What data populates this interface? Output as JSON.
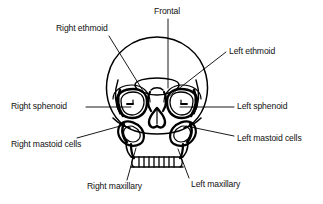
{
  "figure": {
    "view": "anterior",
    "line_color": "#000000",
    "background_color": "#ffffff",
    "text_color": "#111111"
  },
  "labels": [
    {
      "id": "frontal",
      "text": "Frontal",
      "side": "center",
      "anchor": "left",
      "x": 154,
      "y": 6,
      "leader": {
        "type": "straight",
        "points": "168,19 168,88"
      },
      "target": "frontal sinus"
    },
    {
      "id": "right-ethmoid",
      "text": "Right ethmoid",
      "side": "right",
      "anchor": "left",
      "x": 56,
      "y": 23,
      "leader": {
        "type": "straight",
        "points": "109,36 148,99"
      },
      "target": "right ethmoid air cells"
    },
    {
      "id": "left-ethmoid",
      "text": "Left ethmoid",
      "side": "left",
      "anchor": "left",
      "x": 229,
      "y": 46,
      "leader": {
        "type": "straight",
        "points": "226,52 168,97"
      },
      "target": "left ethmoid air cells"
    },
    {
      "id": "right-sphenoid",
      "text": "Right sphenoid",
      "side": "right",
      "anchor": "right",
      "x": 11,
      "y": 101,
      "leader": {
        "type": "straight",
        "points": "86,107 131,107"
      },
      "target": "right sphenoid sinus"
    },
    {
      "id": "left-sphenoid",
      "text": "Left sphenoid",
      "side": "left",
      "anchor": "left",
      "x": 237,
      "y": 101,
      "leader": {
        "type": "straight",
        "points": "234,107 180,107"
      },
      "target": "left sphenoid sinus"
    },
    {
      "id": "right-mastoid-cells",
      "text": "Right mastoid cells",
      "side": "right",
      "anchor": "right",
      "x": 11,
      "y": 139,
      "leader": {
        "type": "straight",
        "points": "77,138 124,125"
      },
      "target": "right mastoid air cells"
    },
    {
      "id": "left-mastoid-cells",
      "text": "Left mastoid cells",
      "side": "left",
      "anchor": "left",
      "x": 237,
      "y": 133,
      "leader": {
        "type": "straight",
        "points": "234,136 186,126"
      },
      "target": "left mastoid air cells"
    },
    {
      "id": "right-maxillary",
      "text": "Right maxillary",
      "side": "right",
      "anchor": "left",
      "x": 87,
      "y": 181,
      "leader": {
        "type": "straight",
        "points": "127,180 136,148"
      },
      "target": "right maxillary sinus"
    },
    {
      "id": "left-maxillary",
      "text": "Left maxillary",
      "side": "left",
      "anchor": "left",
      "x": 191,
      "y": 179,
      "leader": {
        "type": "straight",
        "points": "189,178 178,149"
      },
      "target": "left maxillary sinus"
    }
  ],
  "anatomy": {
    "structures": [
      "cranial vault",
      "frontal sinus",
      "right orbit",
      "left orbit",
      "right ethmoid air cells",
      "left ethmoid air cells",
      "nasal cavity",
      "right maxillary sinus",
      "left maxillary sinus",
      "right mastoid air cells",
      "left mastoid air cells",
      "upper dental arch",
      "zygomatic arches"
    ],
    "tooth_count": 10
  }
}
